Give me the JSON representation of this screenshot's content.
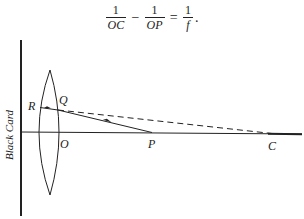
{
  "formula": {
    "term1": {
      "numerator": "1",
      "denominator": "OC"
    },
    "op1": "−",
    "term2": {
      "numerator": "1",
      "denominator": "OP"
    },
    "op2": "=",
    "term3": {
      "numerator": "1",
      "denominator": "f"
    },
    "trailing": "."
  },
  "diagram": {
    "card_label": "Black Card",
    "points": {
      "R": "R",
      "Q": "Q",
      "O": "O",
      "P": "P",
      "C": "C"
    },
    "colors": {
      "ink": "#222222",
      "background": "#ffffff"
    }
  }
}
